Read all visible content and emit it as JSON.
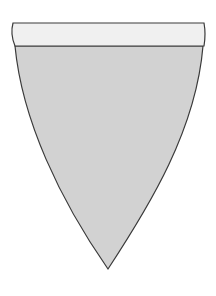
{
  "figure": {
    "shape": "pennant-banner",
    "colors": {
      "background": "#ffffff",
      "band_fill": "#f0f0f0",
      "body_fill": "#d2d2d2",
      "stroke": "#3a3a3a"
    }
  }
}
